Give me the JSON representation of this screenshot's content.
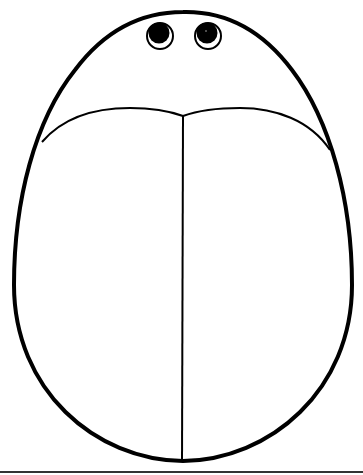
{
  "figure": {
    "colors": {
      "stroke": "#000000",
      "background": "#ffffff"
    },
    "parts": [
      "body-outline",
      "wing-top-curve",
      "wing-divider-line",
      "left-eye",
      "right-eye",
      "baseline-rule"
    ]
  }
}
